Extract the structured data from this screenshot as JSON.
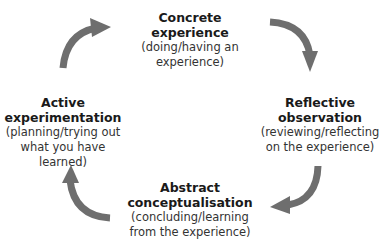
{
  "diagram": {
    "type": "cycle",
    "arrow_color": "#6e6e6e",
    "nodes": [
      {
        "position": "top",
        "title_line1": "Concrete",
        "title_line2": "experience",
        "desc_line1": "(doing/having an",
        "desc_line2": "experience)"
      },
      {
        "position": "right",
        "title_line1": "Reflective",
        "title_line2": "observation",
        "desc_line1": "(reviewing/reflecting",
        "desc_line2": "on the experience)"
      },
      {
        "position": "bottom",
        "title_line1": "Abstract",
        "title_line2": "conceptualisation",
        "desc_line1": "(concluding/learning",
        "desc_line2": "from the experience)"
      },
      {
        "position": "left",
        "title_line1": "Active",
        "title_line2": "experimentation",
        "desc_line1": "(planning/trying out",
        "desc_line2": "what you have learned)"
      }
    ],
    "edges": [
      {
        "from": "Concrete experience",
        "to": "Reflective observation"
      },
      {
        "from": "Reflective observation",
        "to": "Abstract conceptualisation"
      },
      {
        "from": "Abstract conceptualisation",
        "to": "Active experimentation"
      },
      {
        "from": "Active experimentation",
        "to": "Concrete experience"
      }
    ]
  }
}
